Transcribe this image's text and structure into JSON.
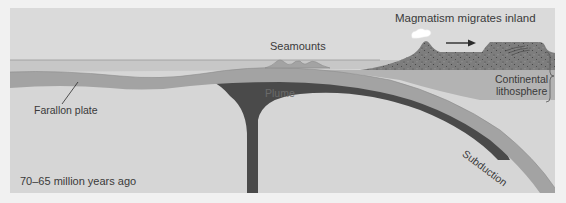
{
  "figure": {
    "time_label": "70–65 million years ago",
    "labels": {
      "magmatism": "Magmatism migrates inland",
      "seamounts": "Seamounts",
      "plume": "Plume",
      "continental_lithosphere_line1": "Continental",
      "continental_lithosphere_line2": "lithosphere",
      "farallon_plate": "Farallon plate",
      "subduction": "Subduction"
    },
    "colors": {
      "page_background": "#f1f1f1",
      "panel_background": "#d4d4d4",
      "ocean": "#c9c9c9",
      "oceanic_plate": "#a2a2a2",
      "plume": "#4a4a4a",
      "continental_crust": "#7d7d7d",
      "continental_lithosphere": "#b2b2b2",
      "mantle_light": "#dcdcdc",
      "text": "#3a3a3a"
    }
  }
}
